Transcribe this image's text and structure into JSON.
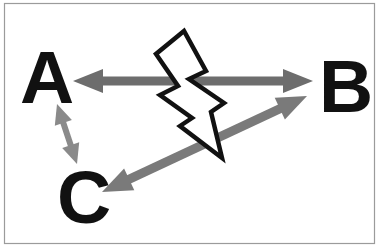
{
  "diagram": {
    "nodes": [
      {
        "id": "A",
        "label": "A"
      },
      {
        "id": "B",
        "label": "B"
      },
      {
        "id": "C",
        "label": "C"
      }
    ],
    "edges": [
      {
        "from": "A",
        "to": "B",
        "bidirectional": true,
        "weight": "thick",
        "state": "blocked-by-lightning-bolt"
      },
      {
        "from": "C",
        "to": "B",
        "bidirectional": true,
        "weight": "thick",
        "state": "normal"
      },
      {
        "from": "A",
        "to": "C",
        "bidirectional": true,
        "weight": "thin",
        "state": "normal"
      }
    ],
    "symbols": [
      {
        "name": "lightning-bolt",
        "fill": "#ffffff",
        "outline": "#111111"
      }
    ]
  },
  "colors": {
    "background": "#ffffff",
    "frame": "#9b9b9b",
    "letter": "#111111",
    "edge_ab": "#6d6d6d",
    "edge_cb": "#7a7a7a",
    "edge_ac": "#8a8a8a",
    "bolt_fill": "#ffffff",
    "bolt_stroke": "#111111"
  }
}
